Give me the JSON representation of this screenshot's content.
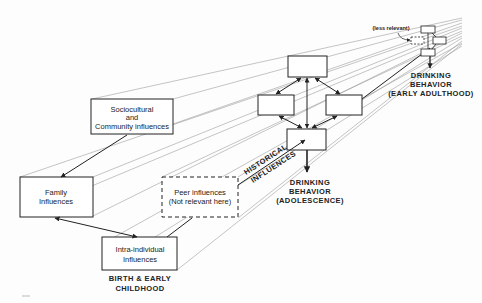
{
  "diagram": {
    "title": "",
    "stages": {
      "childhood": {
        "caption_line1": "BIRTH & EARLY",
        "caption_line2": "CHILDHOOD",
        "nodes": {
          "sociocultural": {
            "line1": "Sociocultural",
            "line2": "and",
            "line3": "Community influences"
          },
          "family": {
            "line1": "Family",
            "line2": "Influences"
          },
          "peer": {
            "line1": "Peer influences",
            "line2": "(Not relevant here)",
            "style": "dashed"
          },
          "intra": {
            "line1": "Intra-individual",
            "line2": "Influences"
          }
        }
      },
      "adolescence": {
        "outcome_line1": "DRINKING",
        "outcome_line2": "BEHAVIOR",
        "outcome_line3": "(ADOLESCENCE)"
      },
      "early_adulthood": {
        "annotation": "(less relevant)",
        "outcome_line1": "DRINKING",
        "outcome_line2": "BEHAVIOR",
        "outcome_line3": "(EARLY ADULTHOOD)"
      }
    },
    "axis_label_line1": "HISTORICAL",
    "axis_label_line2": "INFLUENCES",
    "colors": {
      "line": "#222222",
      "perspective": "#8a8a8a",
      "background": "#fdfdfd"
    }
  }
}
